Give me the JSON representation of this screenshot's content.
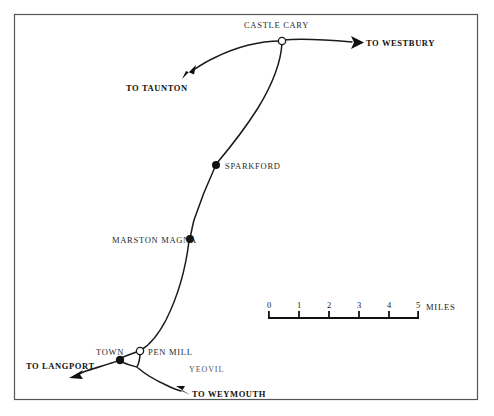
{
  "map": {
    "title": "Railway map of the Castle Cary to Yeovil area",
    "background_color": "#ffffff",
    "line_color": "#1a1a1a",
    "border_color": "#555555",
    "border": {
      "x": 14,
      "y": 14,
      "width": 464,
      "height": 386
    },
    "stations": [
      {
        "name": "CASTLE CARY",
        "marker": "open-circle",
        "marker_x": 282,
        "marker_y": 41,
        "label_x": 244,
        "label_y": 21
      },
      {
        "name": "SPARKFORD",
        "marker": "filled-dot",
        "marker_x": 216,
        "marker_y": 165,
        "label_x": 225,
        "label_y": 162
      },
      {
        "name": "MARSTON MAGNA",
        "marker": "filled-dot",
        "marker_x": 190,
        "marker_y": 239,
        "label_x": 112,
        "label_y": 236
      },
      {
        "name": "TOWN",
        "marker": "filled-dot",
        "marker_x": 120,
        "marker_y": 360,
        "label_x": 96,
        "label_y": 348
      },
      {
        "name": "PEN MILL",
        "marker": "open-circle",
        "marker_x": 140,
        "marker_y": 351,
        "label_x": 148,
        "label_y": 348
      }
    ],
    "destinations": [
      {
        "name": "TO WESTBURY",
        "label_x": 366,
        "label_y": 39,
        "arrow_direction": "right"
      },
      {
        "name": "TO TAUNTON",
        "label_x": 126,
        "label_y": 84,
        "arrow_direction": "down-left"
      },
      {
        "name": "TO LANGPORT",
        "label_x": 26,
        "label_y": 362,
        "arrow_direction": "left"
      },
      {
        "name": "TO WEYMOUTH",
        "label_x": 192,
        "label_y": 390,
        "arrow_direction": "down-left"
      }
    ],
    "areas": [
      {
        "name": "YEOVIL",
        "label_x": 189,
        "label_y": 366
      }
    ],
    "scale_bar": {
      "unit_label": "MILES",
      "ticks": [
        "0",
        "1",
        "2",
        "3",
        "4",
        "5"
      ],
      "x_start": 268,
      "x_end": 419,
      "y_baseline": 318,
      "tick_height": 6,
      "unit_label_x": 426,
      "unit_label_y": 309
    }
  }
}
